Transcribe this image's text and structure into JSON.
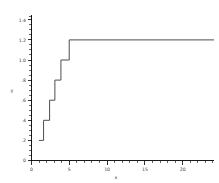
{
  "chart_data": {
    "type": "line",
    "title": "",
    "subtitle": "",
    "xlabel": "x",
    "ylabel": "y",
    "xlim": [
      0,
      24.2
    ],
    "ylim": [
      0,
      1.45
    ],
    "grid": false,
    "legend": null,
    "legend_position": "none",
    "line_style": "step-post",
    "line_color": "#4d4d4d",
    "x_ticks_major": [
      0,
      5,
      10,
      15,
      20
    ],
    "x_tick_labels": [
      "0",
      "5",
      "10",
      "15",
      "20"
    ],
    "x_minor_tick_interval": 1,
    "y_ticks_major": [
      0,
      0.2,
      0.4,
      0.6,
      0.8,
      1.0,
      1.2,
      1.4
    ],
    "y_tick_labels": [
      "0",
      ".2",
      ".4",
      ".6",
      ".8",
      "1.0",
      "1.2",
      "1.4"
    ],
    "y_minor_tick_interval": 0.05,
    "series": [
      {
        "name": "step",
        "x": [
          1.0,
          1.6,
          2.4,
          3.1,
          3.9,
          5.0,
          24.2
        ],
        "y": [
          0.2,
          0.4,
          0.6,
          0.8,
          1.0,
          1.2,
          1.2
        ]
      }
    ],
    "steps": [
      {
        "x_start": 1.0,
        "x_end": 1.6,
        "y": 0.2
      },
      {
        "x_start": 1.6,
        "x_end": 2.4,
        "y": 0.4
      },
      {
        "x_start": 2.4,
        "x_end": 3.1,
        "y": 0.6
      },
      {
        "x_start": 3.1,
        "x_end": 3.9,
        "y": 0.8
      },
      {
        "x_start": 3.9,
        "x_end": 5.0,
        "y": 1.0
      },
      {
        "x_start": 5.0,
        "x_end": 24.2,
        "y": 1.2
      }
    ],
    "annotations": []
  },
  "axes": {
    "y_title": "y",
    "x_title": "x"
  }
}
